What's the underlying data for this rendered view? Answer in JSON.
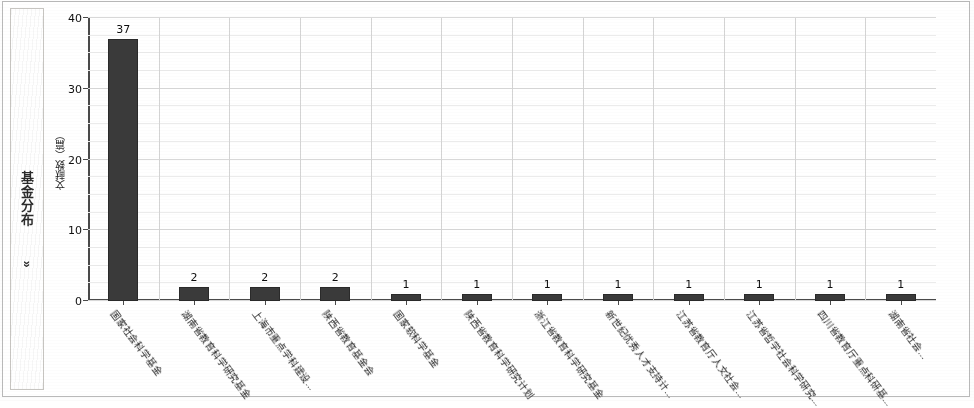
{
  "sidebar": {
    "label": "基金分布",
    "chevron": "»"
  },
  "chart_data": {
    "type": "bar",
    "title": "",
    "xlabel": "",
    "ylabel": "文献数（篇）",
    "ylim": [
      0,
      40
    ],
    "yticks": [
      0,
      10,
      20,
      30,
      40
    ],
    "ytick_labels": [
      "0",
      "10",
      "20",
      "30",
      "40"
    ],
    "grid": true,
    "legend": null,
    "categories": [
      "国家社会科学基金",
      "湖南省教育科学研究基金",
      "上海市重点学科建设...",
      "陕西省教育基金会",
      "国家软科学基金",
      "陕西省教育科学研究计划",
      "浙江省教育科学研究基金",
      "新世纪优秀人才支持计...",
      "江苏省教育厅人文社会...",
      "江苏省哲学社会科学研究...",
      "四川省教育厅重点科研基...",
      "湖南省社会..."
    ],
    "values": [
      37,
      2,
      2,
      2,
      1,
      1,
      1,
      1,
      1,
      1,
      1,
      1
    ],
    "value_labels": [
      "37",
      "2",
      "2",
      "2",
      "1",
      "1",
      "1",
      "1",
      "1",
      "1",
      "1",
      "1"
    ],
    "bar_color": "#3a3a3a"
  }
}
